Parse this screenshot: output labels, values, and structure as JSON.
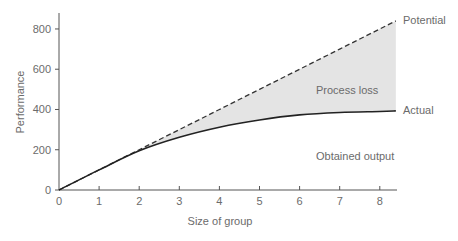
{
  "chart_data": {
    "type": "line",
    "title": "",
    "xlabel": "Size of group",
    "ylabel": "Performance",
    "xlim": [
      0,
      8.4
    ],
    "ylim": [
      0,
      880
    ],
    "x_ticks": [
      0,
      1,
      2,
      3,
      4,
      5,
      6,
      7,
      8
    ],
    "y_ticks": [
      0,
      200,
      400,
      600,
      800
    ],
    "grid": false,
    "legend": "none (series labeled directly at right end)",
    "x": [
      0,
      1,
      2,
      3,
      4,
      5,
      6,
      7,
      8,
      8.4
    ],
    "series": [
      {
        "name": "Potential",
        "style": "dashed",
        "color": "#333333",
        "values": [
          0,
          100,
          200,
          300,
          400,
          500,
          600,
          700,
          800,
          840
        ]
      },
      {
        "name": "Actual",
        "style": "solid",
        "color": "#222222",
        "values": [
          0,
          100,
          195,
          262,
          312,
          348,
          373,
          385,
          390,
          393
        ]
      }
    ],
    "annotations": [
      {
        "text": "Process loss",
        "note": "shaded region between Potential and Actual",
        "fill": "#e3e3e3"
      },
      {
        "text": "Obtained output",
        "note": "region below Actual"
      }
    ]
  },
  "labels": {
    "xlabel": "Size of group",
    "ylabel": "Performance",
    "potential": "Potential",
    "actual": "Actual",
    "process_loss": "Process loss",
    "obtained_output": "Obtained output"
  },
  "ticks": {
    "x": [
      "0",
      "1",
      "2",
      "3",
      "4",
      "5",
      "6",
      "7",
      "8"
    ],
    "y": [
      "0",
      "200",
      "400",
      "600",
      "800"
    ]
  }
}
